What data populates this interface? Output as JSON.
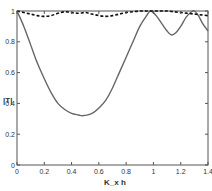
{
  "chart_data": {
    "type": "line",
    "title": "",
    "xlabel": "K_x h",
    "ylabel": "|T|",
    "xlim": [
      0,
      1.4
    ],
    "ylim": [
      0,
      1
    ],
    "grid": false,
    "legend": null,
    "x_ticks": [
      "0",
      "0.2",
      "0.4",
      "0.6",
      "0.8",
      "1",
      "1.2",
      "1.4"
    ],
    "y_ticks": [
      "0",
      "0.2",
      "0.4",
      "0.6",
      "0.8",
      "1"
    ],
    "series": [
      {
        "name": "solid",
        "style": "solid",
        "color": "#666666",
        "x": [
          0,
          0.05,
          0.1,
          0.15,
          0.2,
          0.25,
          0.3,
          0.35,
          0.4,
          0.45,
          0.48,
          0.52,
          0.56,
          0.6,
          0.65,
          0.7,
          0.75,
          0.8,
          0.85,
          0.9,
          0.95,
          0.98,
          1.02,
          1.06,
          1.1,
          1.13,
          1.16,
          1.2,
          1.24,
          1.28,
          1.3,
          1.33,
          1.36,
          1.4
        ],
        "y": [
          1.0,
          0.9,
          0.78,
          0.66,
          0.56,
          0.47,
          0.4,
          0.36,
          0.335,
          0.325,
          0.32,
          0.325,
          0.34,
          0.37,
          0.42,
          0.5,
          0.6,
          0.7,
          0.8,
          0.9,
          0.97,
          1.0,
          0.97,
          0.92,
          0.87,
          0.845,
          0.855,
          0.9,
          0.96,
          0.995,
          1.0,
          0.97,
          0.92,
          0.87
        ]
      },
      {
        "name": "dashed",
        "style": "dashed",
        "color": "#111111",
        "x": [
          0,
          0.05,
          0.1,
          0.15,
          0.2,
          0.25,
          0.3,
          0.35,
          0.4,
          0.45,
          0.5,
          0.55,
          0.6,
          0.65,
          0.7,
          0.75,
          0.8,
          0.85,
          0.9,
          0.95,
          1.0,
          1.05,
          1.1,
          1.15,
          1.2,
          1.25,
          1.3,
          1.35,
          1.4
        ],
        "y": [
          1.0,
          0.99,
          0.98,
          0.97,
          0.965,
          0.97,
          0.985,
          0.995,
          0.99,
          0.985,
          0.99,
          0.98,
          0.97,
          0.965,
          0.97,
          0.98,
          0.99,
          0.995,
          1.0,
          1.0,
          1.0,
          1.0,
          1.0,
          0.995,
          0.99,
          0.985,
          0.98,
          0.975,
          0.97
        ]
      }
    ]
  }
}
